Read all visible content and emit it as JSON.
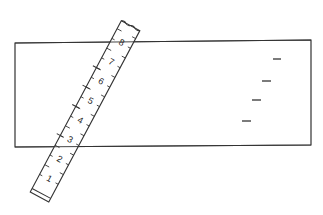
{
  "diagram": {
    "rectangle": {
      "x1": 15,
      "y1": 43,
      "x2": 311,
      "y2": 40,
      "x3": 311,
      "y3": 145,
      "x4": 15,
      "y4": 147
    },
    "ruler": {
      "labels": [
        "1",
        "2",
        "3",
        "4",
        "5",
        "6",
        "7",
        "8"
      ]
    },
    "side_marks": [
      {
        "x1": 273,
        "x2": 281,
        "y": 59
      },
      {
        "x1": 262,
        "x2": 271,
        "y": 81
      },
      {
        "x1": 252,
        "x2": 261,
        "y": 100
      },
      {
        "x1": 242,
        "x2": 251,
        "y": 121
      }
    ],
    "colors": {
      "stroke": "#333333",
      "background": "#ffffff"
    }
  }
}
